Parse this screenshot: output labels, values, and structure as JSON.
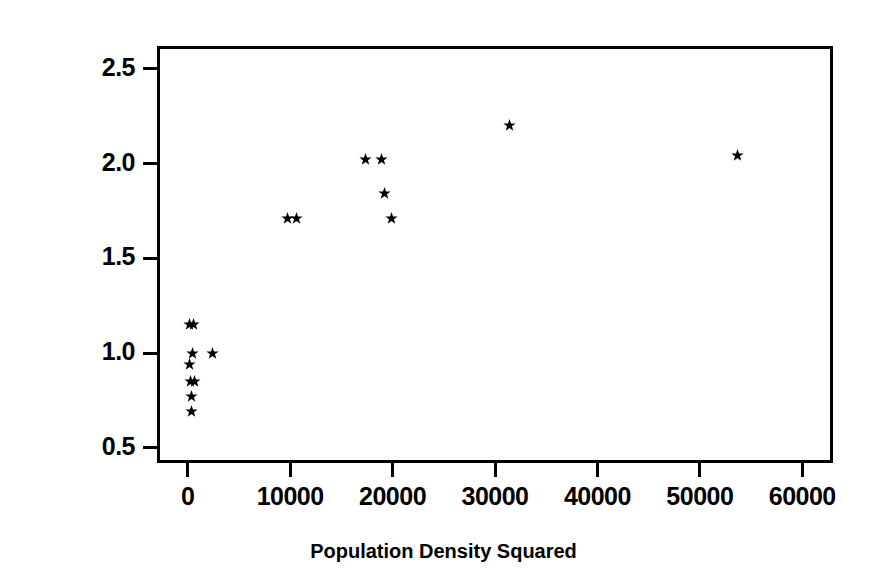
{
  "chart_data": {
    "type": "scatter",
    "title": "",
    "xlabel": "Population Density Squared",
    "ylabel": "log(Ag Intensity)",
    "xlim": [
      -3000,
      63000
    ],
    "ylim": [
      0.42,
      2.62
    ],
    "xticks": [
      0,
      10000,
      20000,
      30000,
      40000,
      50000,
      60000
    ],
    "xtick_labels": [
      "0",
      "10000",
      "20000",
      "30000",
      "40000",
      "50000",
      "60000"
    ],
    "yticks": [
      0.5,
      1.0,
      1.5,
      2.0,
      2.5
    ],
    "ytick_labels": [
      "0.5",
      "1.0",
      "1.5",
      "2.0",
      "2.5"
    ],
    "grid": false,
    "legend": null,
    "marker": "star",
    "marker_color": "#000000",
    "frame_color": "#000000",
    "background": "#ffffff",
    "points": [
      {
        "x": 150,
        "y": 1.15
      },
      {
        "x": 600,
        "y": 1.15
      },
      {
        "x": 420,
        "y": 1.0
      },
      {
        "x": 2400,
        "y": 1.0
      },
      {
        "x": 170,
        "y": 0.94
      },
      {
        "x": 300,
        "y": 0.85
      },
      {
        "x": 700,
        "y": 0.85
      },
      {
        "x": 320,
        "y": 0.77
      },
      {
        "x": 360,
        "y": 0.69
      },
      {
        "x": 9700,
        "y": 1.71
      },
      {
        "x": 10600,
        "y": 1.71
      },
      {
        "x": 17400,
        "y": 2.02
      },
      {
        "x": 18900,
        "y": 2.02
      },
      {
        "x": 19200,
        "y": 1.84
      },
      {
        "x": 19900,
        "y": 1.71
      },
      {
        "x": 31400,
        "y": 2.2
      },
      {
        "x": 53700,
        "y": 2.04
      }
    ]
  }
}
